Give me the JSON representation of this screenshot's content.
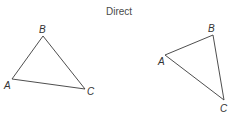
{
  "title": "Direct",
  "colors": {
    "stroke": "#3a3a3a",
    "label": "#333333",
    "title": "#4a4a4a"
  },
  "triangles": [
    {
      "name": "left",
      "vertices": {
        "A": {
          "x": 12,
          "y": 79,
          "label": "A",
          "lx": 4,
          "ly": 89
        },
        "B": {
          "x": 43,
          "y": 36,
          "label": "B",
          "lx": 39,
          "ly": 33
        },
        "C": {
          "x": 85,
          "y": 89,
          "label": "C",
          "lx": 87,
          "ly": 95
        }
      }
    },
    {
      "name": "right",
      "vertices": {
        "A": {
          "x": 165,
          "y": 55,
          "label": "A",
          "lx": 158,
          "ly": 65
        },
        "B": {
          "x": 213,
          "y": 35,
          "label": "B",
          "lx": 208,
          "ly": 32
        },
        "C": {
          "x": 224,
          "y": 100,
          "label": "C",
          "lx": 220,
          "ly": 112
        }
      }
    }
  ]
}
